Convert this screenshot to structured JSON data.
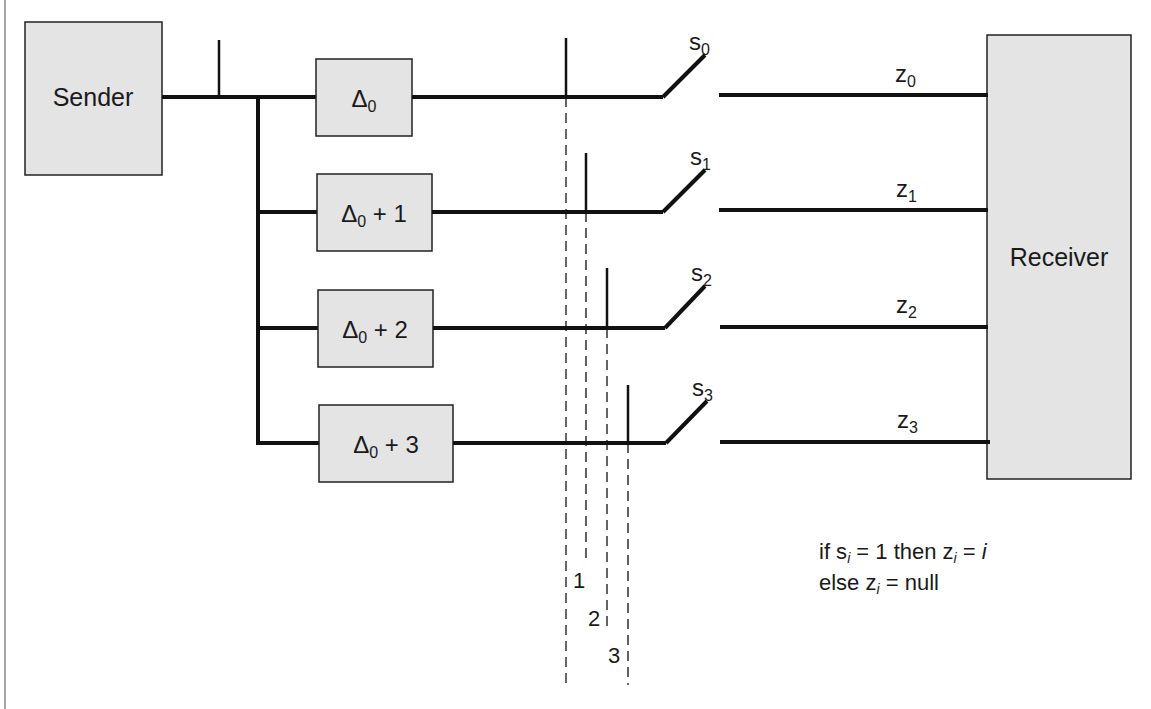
{
  "diagram": {
    "sender": {
      "label": "Sender"
    },
    "receiver": {
      "label": "Receiver"
    },
    "delay_boxes": [
      {
        "symbol": "Δ",
        "sub": "0",
        "suffix": ""
      },
      {
        "symbol": "Δ",
        "sub": "0",
        "suffix": " + 1"
      },
      {
        "symbol": "Δ",
        "sub": "0",
        "suffix": " + 2"
      },
      {
        "symbol": "Δ",
        "sub": "0",
        "suffix": " + 3"
      }
    ],
    "switches": [
      {
        "base": "s",
        "sub": "0"
      },
      {
        "base": "s",
        "sub": "1"
      },
      {
        "base": "s",
        "sub": "2"
      },
      {
        "base": "s",
        "sub": "3"
      }
    ],
    "outputs": [
      {
        "base": "z",
        "sub": "0"
      },
      {
        "base": "z",
        "sub": "1"
      },
      {
        "base": "z",
        "sub": "2"
      },
      {
        "base": "z",
        "sub": "3"
      }
    ],
    "time_markers": [
      "1",
      "2",
      "3"
    ],
    "rule": {
      "line1": {
        "a": "if s",
        "a_sub": "i",
        "b": " = 1 then z",
        "b_sub": "i",
        "c": " = ",
        "c_ital": "i"
      },
      "line2": {
        "a": "else z",
        "a_sub": "i",
        "b": " = null"
      }
    },
    "colors": {
      "box_fill": "#e4e4e4",
      "line": "#111111",
      "background": "#ffffff"
    }
  }
}
